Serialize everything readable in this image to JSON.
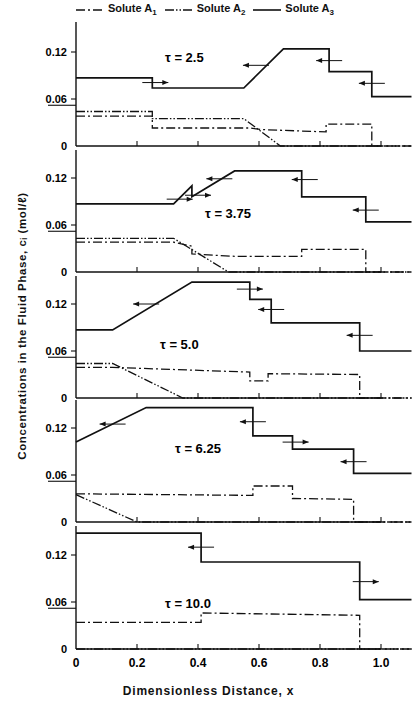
{
  "legend": [
    {
      "name": "Solute A",
      "sub": "1",
      "style": "dash-dot"
    },
    {
      "name": "Solute A",
      "sub": "2",
      "style": "dash-dot-dot"
    },
    {
      "name": "Solute A",
      "sub": "3",
      "style": "solid"
    }
  ],
  "axis": {
    "ylabel": "Concentrations in the Fluid Phase, cᵢ (mol/ℓ)",
    "xlabel": "Dimensionless Distance, x",
    "xticks": [
      "0",
      "0.2",
      "0.4",
      "0.6",
      "0.8",
      "1.0"
    ],
    "yticks": [
      "0",
      "0.06",
      "0.12"
    ]
  },
  "chart_data": {
    "type": "line",
    "title": "",
    "xlabel": "Dimensionless Distance, x",
    "ylabel": "Concentrations in the Fluid Phase, c_i (mol/l)",
    "xlim": [
      0,
      1.1
    ],
    "ylim": [
      0,
      0.15
    ],
    "grid": false,
    "legend_position": "top",
    "panels": [
      {
        "label": "τ = 2.5",
        "series": [
          {
            "name": "Solute A3",
            "x": [
              0,
              0.25,
              0.25,
              0.55,
              0.68,
              0.83,
              0.83,
              0.97,
              0.97,
              1.1
            ],
            "y": [
              0.087,
              0.087,
              0.074,
              0.074,
              0.124,
              0.124,
              0.095,
              0.095,
              0.063,
              0.063
            ]
          },
          {
            "name": "Solute A1",
            "x": [
              0,
              0.25,
              0.25,
              0.57,
              0.61,
              0.82,
              0.82,
              0.97,
              0.97,
              1.1
            ],
            "y": [
              0.038,
              0.038,
              0.023,
              0.023,
              0.021,
              0.018,
              0.028,
              0.028,
              0,
              0
            ]
          },
          {
            "name": "Solute A2",
            "x": [
              0,
              0.25,
              0.25,
              0.55,
              0.67,
              1.1
            ],
            "y": [
              0.044,
              0.044,
              0.035,
              0.035,
              0,
              0
            ]
          }
        ],
        "arrows": [
          {
            "x": 0.26,
            "y": 0.081,
            "dir": "right"
          },
          {
            "x": 0.59,
            "y": 0.103,
            "dir": "left"
          },
          {
            "x": 0.83,
            "y": 0.109,
            "dir": "left"
          },
          {
            "x": 0.97,
            "y": 0.08,
            "dir": "left"
          }
        ]
      },
      {
        "label": "τ = 3.75",
        "series": [
          {
            "name": "Solute A3",
            "x": [
              0,
              0.32,
              0.38,
              0.38,
              0.52,
              0.74,
              0.74,
              0.95,
              0.95,
              1.1
            ],
            "y": [
              0.087,
              0.087,
              0.11,
              0.096,
              0.129,
              0.129,
              0.096,
              0.096,
              0.064,
              0.064
            ]
          },
          {
            "name": "Solute A1",
            "x": [
              0,
              0.32,
              0.38,
              0.38,
              0.52,
              0.74,
              0.74,
              0.95,
              0.95,
              1.1
            ],
            "y": [
              0.038,
              0.038,
              0.033,
              0.023,
              0.02,
              0.02,
              0.029,
              0.029,
              0,
              0
            ]
          },
          {
            "name": "Solute A2",
            "x": [
              0,
              0.32,
              0.5,
              1.1
            ],
            "y": [
              0.043,
              0.043,
              0,
              0
            ]
          }
        ],
        "arrows": [
          {
            "x": 0.34,
            "y": 0.093,
            "dir": "right"
          },
          {
            "x": 0.4,
            "y": 0.098,
            "dir": "right"
          },
          {
            "x": 0.47,
            "y": 0.119,
            "dir": "left"
          },
          {
            "x": 0.75,
            "y": 0.118,
            "dir": "left"
          },
          {
            "x": 0.95,
            "y": 0.079,
            "dir": "left"
          }
        ]
      },
      {
        "label": "τ = 5.0",
        "series": [
          {
            "name": "Solute A3",
            "x": [
              0,
              0.12,
              0.38,
              0.57,
              0.57,
              0.64,
              0.64,
              0.93,
              0.93,
              1.1
            ],
            "y": [
              0.087,
              0.087,
              0.148,
              0.148,
              0.126,
              0.126,
              0.096,
              0.096,
              0.06,
              0.06
            ]
          },
          {
            "name": "Solute A1",
            "x": [
              0,
              0.12,
              0.57,
              0.57,
              0.63,
              0.63,
              0.93,
              0.93,
              1.1
            ],
            "y": [
              0.039,
              0.039,
              0.033,
              0.022,
              0.022,
              0.031,
              0.03,
              0,
              0
            ]
          },
          {
            "name": "Solute A2",
            "x": [
              0,
              0.12,
              0.35,
              1.1
            ],
            "y": [
              0.044,
              0.044,
              0,
              0
            ]
          }
        ],
        "arrows": [
          {
            "x": 0.23,
            "y": 0.12,
            "dir": "left"
          },
          {
            "x": 0.57,
            "y": 0.139,
            "dir": "right"
          },
          {
            "x": 0.64,
            "y": 0.113,
            "dir": "left"
          },
          {
            "x": 0.93,
            "y": 0.08,
            "dir": "left"
          }
        ]
      },
      {
        "label": "τ = 6.25",
        "series": [
          {
            "name": "Solute A3",
            "x": [
              0,
              0.23,
              0.58,
              0.58,
              0.71,
              0.71,
              0.91,
              0.91,
              1.1
            ],
            "y": [
              0.102,
              0.146,
              0.146,
              0.11,
              0.11,
              0.093,
              0.093,
              0.062,
              0.062
            ]
          },
          {
            "name": "Solute A1",
            "x": [
              0,
              0.58,
              0.58,
              0.71,
              0.71,
              0.91,
              0.91,
              1.1
            ],
            "y": [
              0.036,
              0.034,
              0.046,
              0.046,
              0.03,
              0.029,
              0,
              0
            ]
          },
          {
            "name": "Solute A2",
            "x": [
              0,
              0.2,
              1.1
            ],
            "y": [
              0.035,
              0,
              0
            ]
          }
        ],
        "arrows": [
          {
            "x": 0.12,
            "y": 0.125,
            "dir": "left"
          },
          {
            "x": 0.58,
            "y": 0.128,
            "dir": "left"
          },
          {
            "x": 0.72,
            "y": 0.102,
            "dir": "right"
          },
          {
            "x": 0.91,
            "y": 0.077,
            "dir": "left"
          }
        ]
      },
      {
        "label": "τ = 10.0",
        "series": [
          {
            "name": "Solute A3",
            "x": [
              0,
              0.41,
              0.41,
              0.93,
              0.93,
              1.1
            ],
            "y": [
              0.148,
              0.148,
              0.111,
              0.111,
              0.063,
              0.063
            ]
          },
          {
            "name": "Solute A1",
            "x": [
              0,
              0.41,
              0.41,
              0.93,
              0.93,
              1.1
            ],
            "y": [
              0.034,
              0.034,
              0.046,
              0.043,
              0,
              0
            ]
          },
          {
            "name": "Solute A2",
            "x": [
              0,
              1.1
            ],
            "y": [
              0,
              0
            ]
          }
        ],
        "arrows": [
          {
            "x": 0.41,
            "y": 0.13,
            "dir": "left"
          },
          {
            "x": 0.95,
            "y": 0.086,
            "dir": "right"
          }
        ]
      }
    ]
  }
}
